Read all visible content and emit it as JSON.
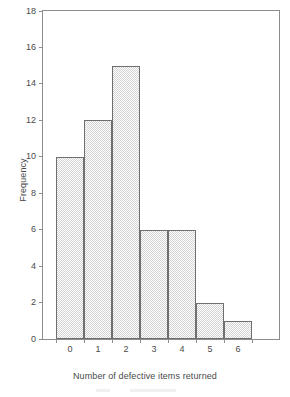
{
  "chart_data": {
    "type": "bar",
    "title": "",
    "subtitle": "",
    "xlabel": "Number of defective items returned",
    "ylabel": "Frequency",
    "categories": [
      "0",
      "1",
      "2",
      "3",
      "4",
      "5",
      "6"
    ],
    "values": [
      10,
      12,
      15,
      6,
      6,
      2,
      1
    ],
    "series": [
      {
        "name": "Frequency",
        "values": [
          10,
          12,
          15,
          6,
          6,
          2,
          1
        ]
      }
    ],
    "ylim": [
      0,
      18
    ],
    "xlim": [
      -0.5,
      6.5
    ],
    "ytick_labels": [
      "0",
      "2",
      "4",
      "6",
      "8",
      "10",
      "12",
      "14",
      "16",
      "18"
    ],
    "ytick_values": [
      0,
      2,
      4,
      6,
      8,
      10,
      12,
      14,
      16,
      18
    ],
    "ytick_step": 2,
    "xtick_labels": [
      "0",
      "1",
      "2",
      "3",
      "4",
      "5",
      "6"
    ],
    "grid": false,
    "legend": false,
    "legend_position": "none",
    "frame": "box",
    "bar_fill": "halftone-checker",
    "colors": {
      "bar_fill": "#e9e9e9",
      "bar_pattern": "#d2d2d2",
      "bar_border": "#6f6f6f",
      "axis": "#8d8d8d",
      "text": "#4a4a4a",
      "background": "#ffffff"
    }
  }
}
